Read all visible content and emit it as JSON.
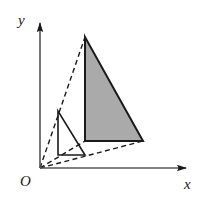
{
  "figure": {
    "background_color": "#ffffff",
    "stroke_color": "#1a1a1a",
    "shaded_fill_color": "#aaaaaa",
    "axes": {
      "x_label": "x",
      "y_label": "y",
      "origin_label": "O",
      "x_axis": {
        "start": [
          40,
          168
        ],
        "end": [
          196,
          168
        ],
        "arrow": "right"
      },
      "y_axis": {
        "start": [
          40,
          168
        ],
        "end": [
          40,
          13
        ],
        "arrow": "up"
      }
    },
    "shapes": [
      {
        "name": "small-triangle",
        "style": "solid-outline",
        "fill": "none",
        "vertices": [
          [
            58,
            111
          ],
          [
            58,
            155
          ],
          [
            85,
            155
          ]
        ]
      },
      {
        "name": "large-triangle",
        "style": "solid-outline-shaded",
        "fill": "#aaaaaa",
        "vertices": [
          [
            85,
            37
          ],
          [
            85,
            141
          ],
          [
            143,
            141
          ]
        ]
      }
    ],
    "dashed_rays": [
      {
        "name": "ray-to-apex",
        "from": [
          40,
          168
        ],
        "to": [
          85,
          37
        ],
        "passes_through": [
          58,
          111
        ]
      },
      {
        "name": "ray-to-left-base",
        "from": [
          40,
          168
        ],
        "to": [
          85,
          141
        ],
        "passes_through": [
          58,
          155
        ]
      },
      {
        "name": "ray-to-right-base",
        "from": [
          40,
          168
        ],
        "to": [
          143,
          141
        ],
        "passes_through": [
          85,
          158
        ]
      }
    ],
    "icon_names": [
      "x-axis-arrow-icon",
      "y-axis-arrow-icon"
    ]
  }
}
